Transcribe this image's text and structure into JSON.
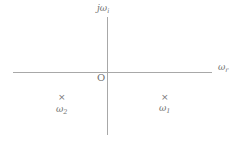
{
  "diagram": {
    "axes": {
      "vertical_label": {
        "base": "jω",
        "sub": "i"
      },
      "horizontal_label": {
        "base": "ω",
        "sub": "r"
      },
      "origin_label": "O"
    },
    "points": [
      {
        "marker": "×",
        "label_base": "ω",
        "label_sub": "1",
        "quadrant": "lower-right"
      },
      {
        "marker": "×",
        "label_base": "ω",
        "label_sub": "2",
        "quadrant": "lower-left"
      }
    ],
    "colors": {
      "line": "#a8a8a8",
      "text": "#707070"
    }
  }
}
